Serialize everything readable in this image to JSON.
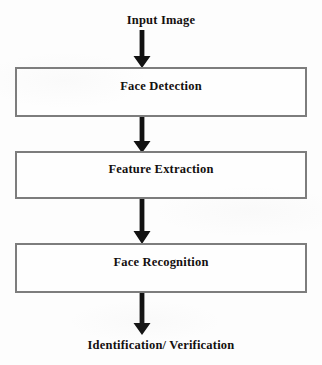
{
  "diagram": {
    "type": "flowchart",
    "orientation": "vertical",
    "colors": {
      "background": "#fdfdfd",
      "box_border": "#7d7d7d",
      "arrow": "#121212",
      "text": "#14100f"
    },
    "input_label": "Input Image",
    "output_label": "Identification/ Verification",
    "steps": [
      {
        "label": "Face Detection"
      },
      {
        "label": "Feature Extraction"
      },
      {
        "label": "Face Recognition"
      }
    ],
    "arrows": [
      {
        "name": "input-to-detection",
        "direction": "down"
      },
      {
        "name": "detection-to-feature",
        "direction": "down"
      },
      {
        "name": "feature-to-recognition",
        "direction": "down"
      },
      {
        "name": "recognition-to-output",
        "direction": "down"
      }
    ]
  }
}
